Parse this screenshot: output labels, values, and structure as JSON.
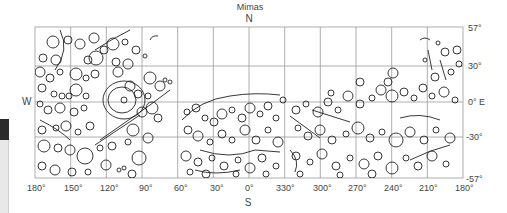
{
  "map": {
    "title": "Mimas",
    "north_label": "N",
    "south_label": "S",
    "west_label": "W",
    "east_label": "E",
    "longitude_labels": [
      "180°",
      "150°",
      "120°",
      "90°",
      "60°",
      "30°",
      "0°",
      "330°",
      "300°",
      "270°",
      "240°",
      "210°",
      "180°"
    ],
    "latitude_labels": [
      "57°",
      "30°",
      "0°",
      "-30°",
      "-57°"
    ],
    "equator_label": "0° E",
    "grid_color": "#888888",
    "feature_color": "#222222"
  },
  "side_panel": {
    "dark_color": "#2b2b2b",
    "light_color": "#e8e8e8"
  }
}
